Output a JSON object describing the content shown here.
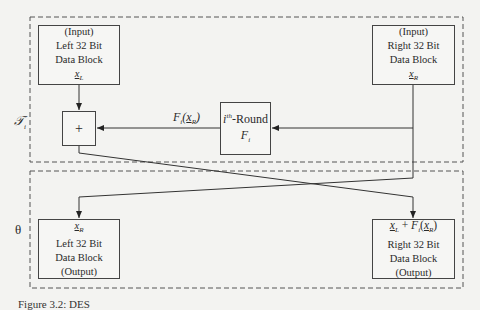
{
  "diagram": {
    "regions": {
      "top_label": "𝒯",
      "top_label_sub": "i",
      "bottom_label": "θ"
    },
    "input_left": {
      "line1": "(Input)",
      "line2": "Left 32 Bit",
      "line3": "Data Block",
      "var": "x",
      "var_sub": "L"
    },
    "input_right": {
      "line1": "(Input)",
      "line2": "Right 32 Bit",
      "line3": "Data Block",
      "var": "x",
      "var_sub": "R"
    },
    "adder": {
      "symbol": "+"
    },
    "round_function": {
      "prefix": "i",
      "prefix_sup": "th",
      "label": "-Round",
      "func": "F",
      "func_sub": "i"
    },
    "edge_label": {
      "func": "F",
      "func_sub": "i",
      "arg": "x",
      "arg_sub": "R"
    },
    "output_left": {
      "var": "x",
      "var_sub": "R",
      "line2": "Left 32 Bit",
      "line3": "Data Block",
      "line4": "(Output)"
    },
    "output_right": {
      "var_a": "x",
      "var_a_sub": "L",
      "plus": "+",
      "func": "F",
      "func_sub": "i",
      "arg": "x",
      "arg_sub": "R",
      "line2": "Right 32 Bit",
      "line3": "Data Block",
      "line4": "(Output)"
    },
    "caption": "Figure 3.2: DES"
  }
}
